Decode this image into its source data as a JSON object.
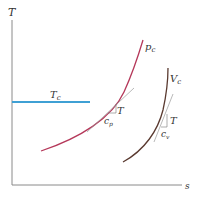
{
  "diagram": {
    "type": "T-s diagram",
    "axes": {
      "y_label": "T",
      "x_label": "s"
    },
    "curves": [
      {
        "name": "isobar",
        "label": "p",
        "subscript": "c",
        "color": "#b5385a"
      },
      {
        "name": "isochore",
        "label": "V",
        "subscript": "c",
        "color": "#5a3a30"
      }
    ],
    "isotherm": {
      "label": "T",
      "subscript": "c",
      "color": "#3fa0d4"
    },
    "slope_triangles": [
      {
        "rise_label": "T",
        "run_label": "c",
        "run_subscript": "p"
      },
      {
        "rise_label": "T",
        "run_label": "c",
        "run_subscript": "v"
      }
    ],
    "colors": {
      "axis": "#888888",
      "tangent": "#999999"
    }
  }
}
